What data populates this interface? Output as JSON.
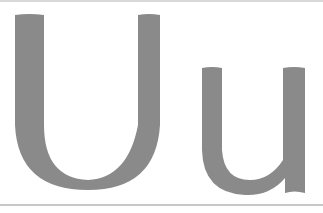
{
  "specimen": {
    "uppercase": "U",
    "lowercase": "u",
    "glyph_color": "#8a8a8a",
    "background": "#ffffff"
  }
}
